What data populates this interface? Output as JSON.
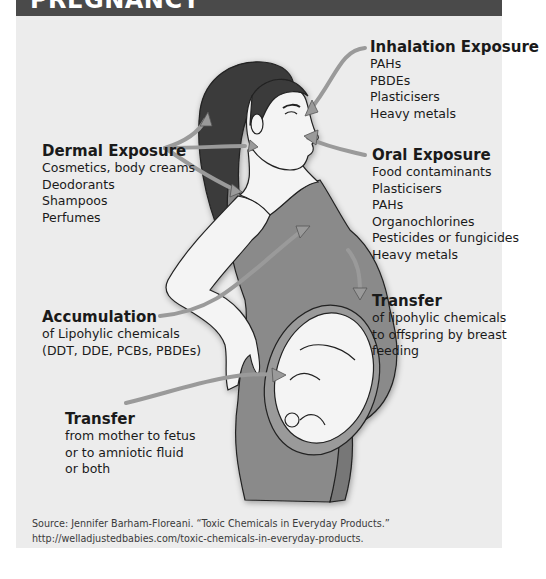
{
  "header": {
    "title": "PREGNANCY"
  },
  "labels": {
    "inhalation": {
      "title": "Inhalation Exposure",
      "items": [
        "PAHs",
        "PBDEs",
        "Plasticisers",
        "Heavy metals"
      ]
    },
    "oral": {
      "title": "Oral Exposure",
      "items": [
        "Food contaminants",
        "Plasticisers",
        "PAHs",
        "Organochlorines",
        "Pesticides or fungicides",
        "Heavy metals"
      ]
    },
    "dermal": {
      "title": "Dermal Exposure",
      "items": [
        "Cosmetics, body creams",
        "Deodorants",
        "Shampoos",
        "Perfumes"
      ]
    },
    "accumulation": {
      "title": "Accumulation",
      "items": [
        "of Lipohylic chemicals",
        "(DDT, DDE, PCBs, PBDEs)"
      ]
    },
    "transfer_breast": {
      "title": "Transfer",
      "items": [
        "of lipohylic chemicals",
        "to offspring by breast",
        "feeding"
      ]
    },
    "transfer_fetus": {
      "title": "Transfer",
      "items": [
        "from mother to fetus",
        "or to amniotic fluid",
        "or both"
      ]
    }
  },
  "source": {
    "line1": "Source: Jennifer Barham-Floreani. “Toxic Chemicals in Everyday Products.”",
    "line2": "http://welladjustedbabies.com/toxic-chemicals-in-everyday-products."
  },
  "colors": {
    "header": "#4a4a4a",
    "panel": "#ececec",
    "dress": "#8a8a8a",
    "skin": "#f4f4f4",
    "hair": "#3a3a3a",
    "arrow": "#9a9a9a"
  }
}
